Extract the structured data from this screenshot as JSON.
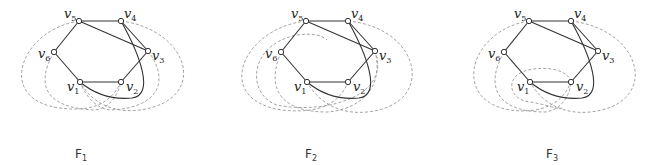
{
  "figures": [
    {
      "id": "F1",
      "caption": "F",
      "caption_sub": "1",
      "vertices": [
        {
          "id": "v1",
          "label": "v",
          "sub": "1"
        },
        {
          "id": "v2",
          "label": "v",
          "sub": "2"
        },
        {
          "id": "v3",
          "label": "v",
          "sub": "3"
        },
        {
          "id": "v4",
          "label": "v",
          "sub": "4"
        },
        {
          "id": "v5",
          "label": "v",
          "sub": "5"
        },
        {
          "id": "v6",
          "label": "v",
          "sub": "6"
        }
      ],
      "solid_edges": [
        [
          "v1",
          "v2"
        ],
        [
          "v2",
          "v3"
        ],
        [
          "v3",
          "v4"
        ],
        [
          "v4",
          "v5"
        ],
        [
          "v5",
          "v6"
        ],
        [
          "v6",
          "v1"
        ],
        [
          "v5",
          "v3"
        ],
        [
          "v4",
          "v1"
        ]
      ],
      "dashed_curves": 4
    },
    {
      "id": "F2",
      "caption": "F",
      "caption_sub": "2",
      "vertices": [
        {
          "id": "v1",
          "label": "v",
          "sub": "1"
        },
        {
          "id": "v2",
          "label": "v",
          "sub": "2"
        },
        {
          "id": "v3",
          "label": "v",
          "sub": "3"
        },
        {
          "id": "v4",
          "label": "v",
          "sub": "4"
        },
        {
          "id": "v5",
          "label": "v",
          "sub": "5"
        },
        {
          "id": "v6",
          "label": "v",
          "sub": "6"
        }
      ],
      "solid_edges": [
        [
          "v1",
          "v2"
        ],
        [
          "v2",
          "v3"
        ],
        [
          "v3",
          "v4"
        ],
        [
          "v4",
          "v5"
        ],
        [
          "v5",
          "v6"
        ],
        [
          "v6",
          "v1"
        ],
        [
          "v5",
          "v3"
        ],
        [
          "v4",
          "v1"
        ]
      ],
      "dashed_curves": 4
    },
    {
      "id": "F3",
      "caption": "F",
      "caption_sub": "3",
      "vertices": [
        {
          "id": "v1",
          "label": "v",
          "sub": "1"
        },
        {
          "id": "v2",
          "label": "v",
          "sub": "2"
        },
        {
          "id": "v3",
          "label": "v",
          "sub": "3"
        },
        {
          "id": "v4",
          "label": "v",
          "sub": "4"
        },
        {
          "id": "v5",
          "label": "v",
          "sub": "5"
        },
        {
          "id": "v6",
          "label": "v",
          "sub": "6"
        }
      ],
      "solid_edges": [
        [
          "v1",
          "v2"
        ],
        [
          "v2",
          "v3"
        ],
        [
          "v3",
          "v4"
        ],
        [
          "v4",
          "v5"
        ],
        [
          "v5",
          "v6"
        ],
        [
          "v6",
          "v1"
        ],
        [
          "v5",
          "v3"
        ],
        [
          "v4",
          "v1"
        ]
      ],
      "dashed_curves": 4
    }
  ]
}
